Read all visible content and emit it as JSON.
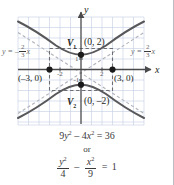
{
  "figure": {
    "type": "hyperbola-graph",
    "axes": {
      "x_label": "x",
      "y_label": "y",
      "x_ticks": [
        {
          "label": "-2",
          "value": -2
        },
        {
          "label": "2",
          "value": 2
        }
      ],
      "y_ticks": [
        {
          "label": "1",
          "value": 1
        },
        {
          "label": "-1",
          "value": -1
        }
      ],
      "x_range": [
        -6,
        6
      ],
      "y_range": [
        -5,
        5
      ],
      "grid": true,
      "grid_color": "#c3cfe0",
      "axis_color": "#4a4a4c"
    },
    "curve_color": "#58585b",
    "asymptote_color": "#b0b3ba",
    "box_color": "#6d6e71",
    "point_color": "#1a1a1a",
    "points": [
      {
        "name": "vertex-upper",
        "tag": "V",
        "tag_sub": "1",
        "coords": "(0, 2)",
        "x": 0,
        "y": 2
      },
      {
        "name": "vertex-lower",
        "tag": "V",
        "tag_sub": "2",
        "coords": "(0, –2)",
        "x": 0,
        "y": -2
      },
      {
        "name": "co-vertex-left",
        "tag": "",
        "tag_sub": "",
        "coords": "(–3, 0)",
        "x": -3,
        "y": 0
      },
      {
        "name": "co-vertex-right",
        "tag": "",
        "tag_sub": "",
        "coords": "(3, 0)",
        "x": 3,
        "y": 0
      }
    ],
    "asymptotes": [
      {
        "name": "asymptote-left",
        "prefix": "y = –",
        "num": "2",
        "den": "3",
        "suffix": "x",
        "slope": -0.6667
      },
      {
        "name": "asymptote-right",
        "prefix": "y = ",
        "num": "2",
        "den": "3",
        "suffix": "x",
        "slope": 0.6667
      }
    ],
    "equations": {
      "standard": "9y² – 4x² = 36",
      "standard_parts": {
        "a": "9",
        "yv": "y",
        "p1": "2",
        "minus": "–",
        "b": "4",
        "xv": "x",
        "p2": "2",
        "eq": "=",
        "rhs": "36"
      },
      "connector": "or",
      "fraction_form": {
        "left_num": "y",
        "left_num_sup": "2",
        "left_den": "4",
        "operator": "–",
        "right_num": "x",
        "right_num_sup": "2",
        "right_den": "9",
        "equals": "=",
        "rhs": "1"
      }
    }
  }
}
